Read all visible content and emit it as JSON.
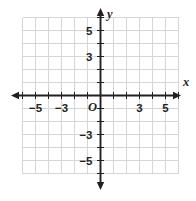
{
  "figure": {
    "type": "coordinate-plane",
    "origin_label": "O",
    "x_axis_name": "x",
    "y_axis_name": "y",
    "background_color": "#ffffff",
    "grid_color": "#d6d6d6",
    "axis_color": "#231f20"
  },
  "chart_data": {
    "type": "scatter",
    "title": "",
    "xlabel": "x",
    "ylabel": "y",
    "xlim": [
      -6,
      6
    ],
    "ylim": [
      -6,
      6
    ],
    "grid": true,
    "legend": "none",
    "series": [],
    "x": [],
    "y": [],
    "x_tick_labels": [
      "-5",
      "-3",
      "3",
      "5"
    ],
    "x_tick_values": [
      -5,
      -3,
      3,
      5
    ],
    "y_tick_labels": [
      "5",
      "3",
      "-3",
      "-5"
    ],
    "y_tick_values": [
      5,
      3,
      -3,
      -5
    ],
    "x_tick_positions_all": [
      -6,
      -5,
      -4,
      -3,
      -2,
      -1,
      1,
      2,
      3,
      4,
      5,
      6
    ],
    "y_tick_positions_all": [
      -6,
      -5,
      -4,
      -3,
      -2,
      -1,
      1,
      2,
      3,
      4,
      5,
      6
    ],
    "grid_x_lines": [
      -6,
      -5,
      -4,
      -3,
      -2,
      -1,
      0,
      1,
      2,
      3,
      4,
      5,
      6
    ],
    "grid_y_lines": [
      -6,
      -5,
      -4,
      -3,
      -2,
      -1,
      0,
      1,
      2,
      3,
      4,
      5,
      6
    ]
  },
  "x_labels": [
    {
      "text": "-5",
      "value": -5
    },
    {
      "text": "-3",
      "value": -3
    },
    {
      "text": "3",
      "value": 3
    },
    {
      "text": "5",
      "value": 5
    }
  ],
  "y_labels": [
    {
      "text": "5",
      "value": 5
    },
    {
      "text": "3",
      "value": 3
    },
    {
      "text": "-3",
      "value": -3
    },
    {
      "text": "-5",
      "value": -5
    }
  ]
}
